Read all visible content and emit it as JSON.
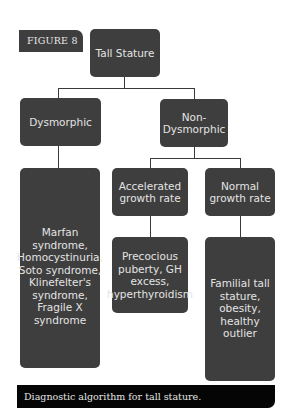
{
  "figure": {
    "label": "FIGURE 8",
    "caption": "Diagnostic algorithm for tall stature."
  },
  "diagram": {
    "root": "Tall Stature",
    "level1": {
      "dysmorphic": "Dysmorphic",
      "non_dysmorphic": "Non-Dysmorphic"
    },
    "level2": {
      "accelerated": "Accelerated growth rate",
      "normal": "Normal growth rate"
    },
    "leaves": {
      "dysmorphic_causes": "Marfan syndrome, Homocystinuria, Soto syndrome, Klinefelter's syndrome, Fragile X syndrome",
      "accelerated_causes": "Precocious puberty, GH excess, hyperthyroidism",
      "normal_causes": "Familial tall stature, obesity, healthy outlier"
    },
    "colors": {
      "box": "#3e3e3e",
      "box_text": "#e4e4e4",
      "caption_bg": "#050505",
      "background": "#ffffff"
    }
  }
}
